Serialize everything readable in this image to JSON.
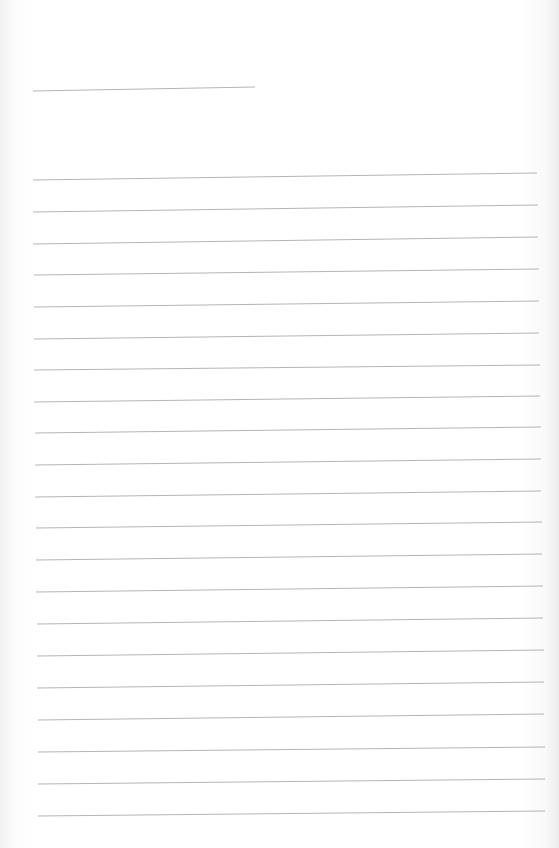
{
  "document": {
    "type": "lined-paper",
    "background_color": "#ffffff",
    "rule_color": "#b4b4b4",
    "header_line": {
      "x1": 33,
      "y1": 91,
      "x2": 255,
      "y2": 87
    },
    "ruled_lines": [
      {
        "x1": 33,
        "y1": 180,
        "x2": 537,
        "y2": 173
      },
      {
        "x1": 33,
        "y1": 212,
        "x2": 538,
        "y2": 205
      },
      {
        "x1": 33,
        "y1": 244,
        "x2": 538,
        "y2": 237
      },
      {
        "x1": 34,
        "y1": 275,
        "x2": 539,
        "y2": 269
      },
      {
        "x1": 34,
        "y1": 307,
        "x2": 539,
        "y2": 301
      },
      {
        "x1": 34,
        "y1": 339,
        "x2": 539,
        "y2": 333
      },
      {
        "x1": 34,
        "y1": 370,
        "x2": 540,
        "y2": 365
      },
      {
        "x1": 34,
        "y1": 402,
        "x2": 540,
        "y2": 396
      },
      {
        "x1": 35,
        "y1": 433,
        "x2": 541,
        "y2": 427
      },
      {
        "x1": 35,
        "y1": 465,
        "x2": 541,
        "y2": 459
      },
      {
        "x1": 35,
        "y1": 497,
        "x2": 541,
        "y2": 491
      },
      {
        "x1": 36,
        "y1": 528,
        "x2": 542,
        "y2": 522
      },
      {
        "x1": 36,
        "y1": 560,
        "x2": 542,
        "y2": 554
      },
      {
        "x1": 36,
        "y1": 592,
        "x2": 543,
        "y2": 586
      },
      {
        "x1": 37,
        "y1": 624,
        "x2": 543,
        "y2": 618
      },
      {
        "x1": 37,
        "y1": 656,
        "x2": 544,
        "y2": 650
      },
      {
        "x1": 37,
        "y1": 688,
        "x2": 544,
        "y2": 682
      },
      {
        "x1": 38,
        "y1": 720,
        "x2": 544,
        "y2": 714
      },
      {
        "x1": 38,
        "y1": 752,
        "x2": 545,
        "y2": 747
      },
      {
        "x1": 38,
        "y1": 784,
        "x2": 545,
        "y2": 779
      },
      {
        "x1": 38,
        "y1": 816,
        "x2": 545,
        "y2": 811
      }
    ]
  }
}
